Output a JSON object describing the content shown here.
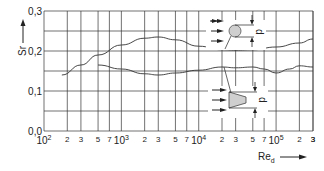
{
  "chart_data": {
    "type": "line",
    "title": "",
    "xlabel": "Re_d",
    "ylabel": "Sr",
    "xscale": "log",
    "xlim": [
      100,
      300000
    ],
    "ylim": [
      0.0,
      0.3
    ],
    "grid": true,
    "y_ticks": [
      "0,0",
      "0,1",
      "0,2",
      "0,3"
    ],
    "y_gridlines": [
      0.0,
      0.05,
      0.1,
      0.15,
      0.2,
      0.25,
      0.3
    ],
    "x_decade_labels": [
      {
        "base": "10",
        "exp": "2",
        "value": 100
      },
      {
        "base": "10",
        "exp": "3",
        "value": 1000
      },
      {
        "base": "10",
        "exp": "4",
        "value": 10000
      },
      {
        "base": "10",
        "exp": "5",
        "value": 100000
      }
    ],
    "x_minor_labels": [
      "2",
      "3",
      "5",
      "7"
    ],
    "series": [
      {
        "name": "circular cylinder",
        "x": [
          170,
          300,
          500,
          1000,
          2000,
          3000,
          5000,
          10000,
          20000,
          30000,
          50000,
          100000,
          200000,
          300000
        ],
        "values": [
          0.14,
          0.165,
          0.19,
          0.215,
          0.232,
          0.235,
          0.228,
          0.212,
          0.203,
          0.202,
          0.203,
          0.21,
          0.22,
          0.23
        ]
      },
      {
        "name": "trapezoidal (wedge) cylinder",
        "x": [
          500,
          1000,
          2000,
          3000,
          5000,
          10000,
          20000,
          30000,
          50000,
          70000,
          100000,
          150000,
          200000,
          300000
        ],
        "values": [
          0.165,
          0.155,
          0.143,
          0.14,
          0.145,
          0.152,
          0.16,
          0.158,
          0.16,
          0.155,
          0.145,
          0.155,
          0.163,
          0.16
        ]
      }
    ],
    "annotations": [
      "d",
      "d"
    ],
    "legend": "inline cross-section sketches (circle, trapezoid) with flow arrows and dimension d"
  },
  "axes": {
    "y_label": "Sr",
    "x_label_main": "Re",
    "x_label_sub": "d"
  },
  "sketch": {
    "dim_label_top": "d",
    "dim_label_bottom": "d"
  }
}
